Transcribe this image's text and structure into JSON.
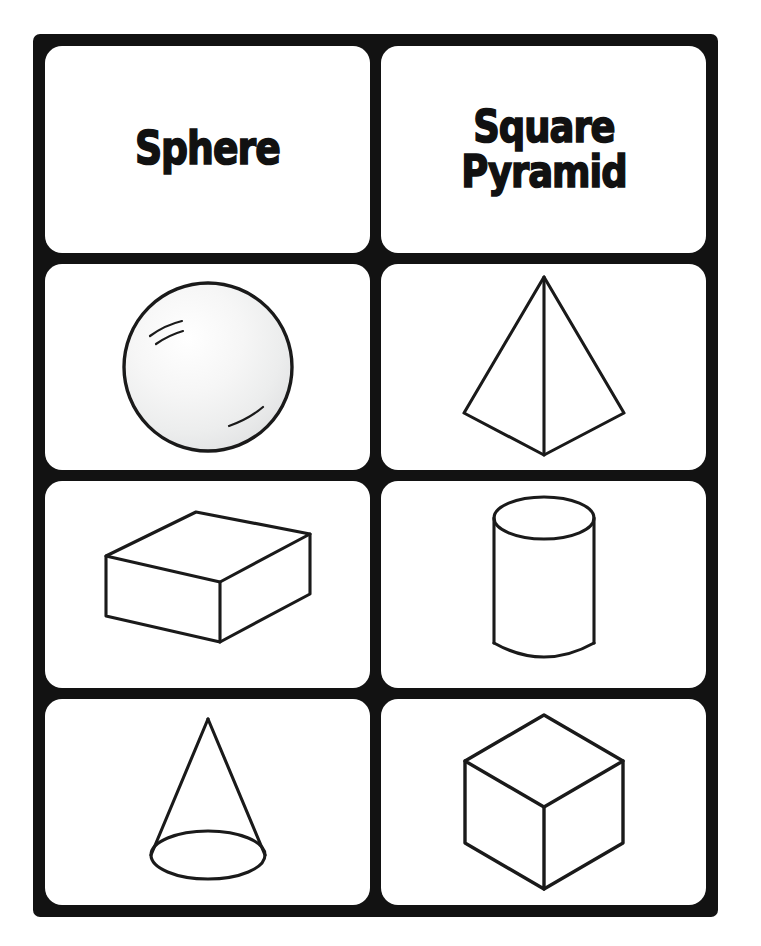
{
  "page": {
    "background_color": "#ffffff",
    "frame_color": "#121212",
    "card_color": "#ffffff",
    "ink_color": "#1a1a1a",
    "columns": 2,
    "rows": 4
  },
  "cards": [
    {
      "id": "word-sphere",
      "type": "word",
      "label": "Sphere",
      "row": 1,
      "column": 1
    },
    {
      "id": "word-square-pyramid",
      "type": "word",
      "label": "Square\nPyramid",
      "row": 1,
      "column": 2
    },
    {
      "id": "figure-sphere",
      "type": "figure",
      "figure": "sphere",
      "label": "Sphere",
      "row": 2,
      "column": 1
    },
    {
      "id": "figure-square-pyramid",
      "type": "figure",
      "figure": "square-pyramid",
      "label": "Square Pyramid",
      "row": 2,
      "column": 2
    },
    {
      "id": "figure-rectangular-prism",
      "type": "figure",
      "figure": "rectangular-prism",
      "label": "Rectangular Prism",
      "row": 3,
      "column": 1
    },
    {
      "id": "figure-cylinder",
      "type": "figure",
      "figure": "cylinder",
      "label": "Cylinder",
      "row": 3,
      "column": 2
    },
    {
      "id": "figure-cone",
      "type": "figure",
      "figure": "cone",
      "label": "Cone",
      "row": 4,
      "column": 1
    },
    {
      "id": "figure-cube",
      "type": "figure",
      "figure": "cube",
      "label": "Cube",
      "row": 4,
      "column": 2
    }
  ]
}
